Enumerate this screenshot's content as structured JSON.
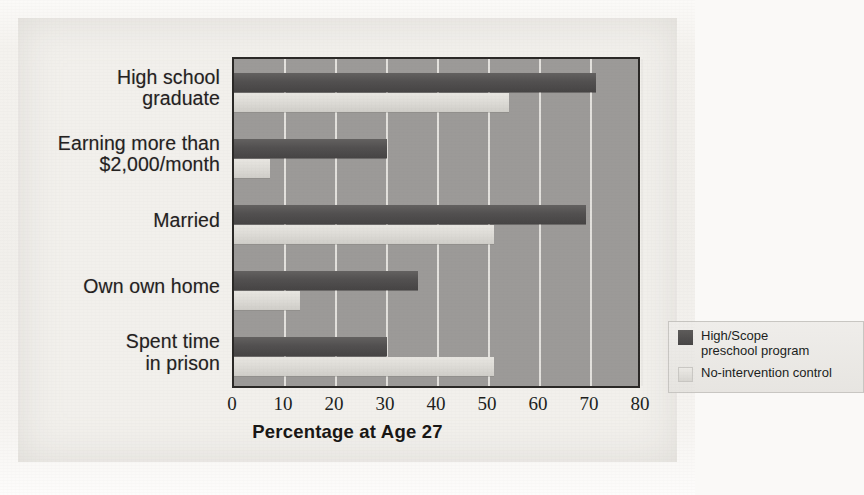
{
  "chart_data": {
    "type": "bar",
    "orientation": "horizontal",
    "title": "",
    "xlabel": "Percentage at Age 27",
    "ylabel": "",
    "xlim": [
      0,
      80
    ],
    "xticks": [
      0,
      10,
      20,
      30,
      40,
      50,
      60,
      70,
      80
    ],
    "xtick_labels": [
      "0",
      "10",
      "20",
      "30",
      "40",
      "50",
      "60",
      "70",
      "80"
    ],
    "grid": "vertical-gridlines-only",
    "legend_position": "inside-right-lower",
    "categories": [
      "High school\ngraduate",
      "Earning more than\n$2,000/month",
      "Married",
      "Own own home",
      "Spent time\nin prison"
    ],
    "series": [
      {
        "name": "High/Scope\npreschool program",
        "legend_label": "High/Scope\npreschool program",
        "color": "#4e4c4b",
        "values": [
          71,
          30,
          69,
          36,
          30
        ]
      },
      {
        "name": "No-intervention control",
        "legend_label": "No-intervention control",
        "color": "#ddebd6",
        "values": [
          54,
          7,
          51,
          13,
          51
        ]
      }
    ],
    "colors": {
      "plot_background": "#9c9a98",
      "gridline": "#e9e7e3",
      "page_background": "#f2f0ec",
      "dark_series": "#4e4c4b",
      "light_series": "#dddbd6",
      "axis_text": "#201e1c",
      "frame": "#2a2826"
    }
  },
  "axis": {
    "x_title": "Percentage at Age 27",
    "ticks": [
      "0",
      "10",
      "20",
      "30",
      "40",
      "50",
      "60",
      "70",
      "80"
    ]
  },
  "categories": [
    {
      "label": "High school\ngraduate"
    },
    {
      "label": "Earning more than\n$2,000/month"
    },
    {
      "label": "Married"
    },
    {
      "label": "Own own home"
    },
    {
      "label": "Spent time\nin prison"
    }
  ],
  "legend": {
    "items": [
      {
        "swatch": "dark-swatch",
        "label": "High/Scope\npreschool program"
      },
      {
        "swatch": "light-swatch",
        "label": "No-intervention control"
      }
    ]
  }
}
